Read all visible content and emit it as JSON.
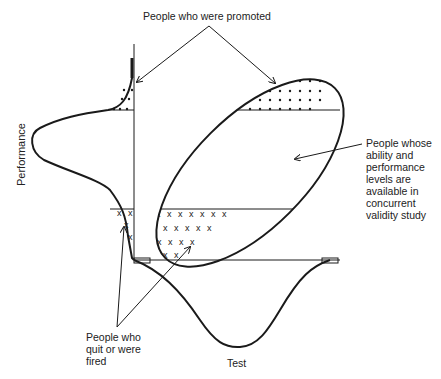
{
  "diagram": {
    "type": "range-restriction scatter with marginal distributions",
    "x_axis_label": "Test",
    "y_axis_label": "Performance",
    "annotations": {
      "promoted": "People who were promoted",
      "concurrent": [
        "People whose",
        "ability and",
        "performance",
        "levels are",
        "available in",
        "concurrent",
        "validity study"
      ],
      "quit_fired": [
        "People who",
        "quit or were",
        "fired"
      ]
    },
    "regions": [
      {
        "name": "promoted",
        "pattern": "dots",
        "location": "top of ellipse and top tail of performance distribution"
      },
      {
        "name": "quit-or-fired",
        "pattern": "x-marks",
        "location": "bottom of ellipse and bottom tail of performance distribution"
      },
      {
        "name": "concurrent-sample",
        "pattern": "blank",
        "location": "middle band of ellipse"
      }
    ],
    "colors": {
      "ink": "#1a1a1a",
      "background": "#ffffff"
    }
  }
}
